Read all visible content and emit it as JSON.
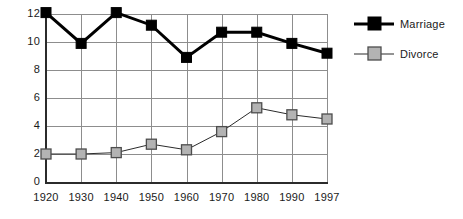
{
  "chart_data": {
    "type": "line",
    "title": "",
    "subtitle": "",
    "xlabel": "",
    "ylabel": "",
    "categories": [
      "1920",
      "1930",
      "1940",
      "1950",
      "1960",
      "1970",
      "1980",
      "1990",
      "1997"
    ],
    "x": [
      1920,
      1930,
      1940,
      1950,
      1960,
      1970,
      1980,
      1990,
      1997
    ],
    "series": [
      {
        "name": "Marriage",
        "values": [
          12.1,
          9.9,
          12.1,
          11.2,
          8.9,
          10.7,
          10.7,
          9.9,
          9.2
        ],
        "color": "#000000",
        "marker": "filled-square",
        "marker_fill": "#000000",
        "marker_edge": "#000000",
        "line_width": 3
      },
      {
        "name": "Divorce",
        "values": [
          2.0,
          2.0,
          2.1,
          2.7,
          2.3,
          3.6,
          5.3,
          4.8,
          4.5
        ],
        "color": "#2b2b2b",
        "marker": "gray-square",
        "marker_fill": "#b3b3b3",
        "marker_edge": "#4d4d4d",
        "line_width": 1
      }
    ],
    "ylim": [
      0,
      12
    ],
    "yticks": [
      0,
      2,
      4,
      6,
      8,
      10,
      12
    ],
    "ytick_labels": [
      "0",
      "2",
      "4",
      "6",
      "8",
      "10",
      "12"
    ],
    "grid": true,
    "grid_color": "#8d8d8d",
    "legend_position": "right",
    "background": "#ffffff",
    "axis_color": "#2b2b2b"
  },
  "legend": {
    "entries": [
      {
        "label": "Marriage"
      },
      {
        "label": "Divorce"
      }
    ]
  }
}
